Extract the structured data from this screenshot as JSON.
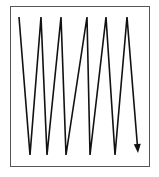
{
  "diagram": {
    "title": "",
    "type": "zigzag-scan-path",
    "frame": {
      "x": 10,
      "y": 6,
      "width": 139,
      "height": 160,
      "stroke": "#555555"
    },
    "path": {
      "stroke": "#111111",
      "points": [
        [
          19,
          17
        ],
        [
          30,
          155
        ],
        [
          41,
          17
        ],
        [
          47,
          155
        ],
        [
          61,
          17
        ],
        [
          66,
          155
        ],
        [
          87,
          17
        ],
        [
          90,
          155
        ],
        [
          106,
          17
        ],
        [
          115,
          155
        ],
        [
          127,
          17
        ],
        [
          138,
          153
        ]
      ],
      "end_marker": "arrow-down"
    }
  }
}
